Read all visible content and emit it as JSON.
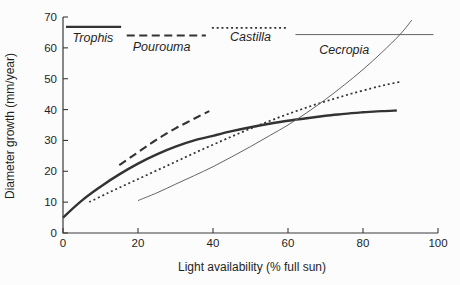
{
  "figure": {
    "background": "#fcfcfc",
    "axis_color": "#3a3a3a",
    "text_color": "#1f1f1f"
  },
  "chart_data": {
    "type": "line",
    "title": "",
    "xlabel": "Light availability (% full sun)",
    "ylabel": "Diameter growth (mm/year)",
    "xlim": [
      0,
      100
    ],
    "ylim": [
      0,
      70
    ],
    "x_ticks": [
      0,
      20,
      40,
      60,
      80,
      100
    ],
    "y_ticks": [
      0,
      10,
      20,
      30,
      40,
      50,
      60,
      70
    ],
    "grid": false,
    "legend_position": "staggered-inside-top",
    "series": [
      {
        "name": "Trophis",
        "style": "solid-thick",
        "color": "#333333",
        "points": [
          [
            0,
            5
          ],
          [
            5,
            10.5
          ],
          [
            10,
            15
          ],
          [
            15,
            19
          ],
          [
            20,
            22.5
          ],
          [
            25,
            25.5
          ],
          [
            30,
            28
          ],
          [
            35,
            30
          ],
          [
            40,
            31.5
          ],
          [
            45,
            33
          ],
          [
            50,
            34.3
          ],
          [
            55,
            35.4
          ],
          [
            60,
            36.4
          ],
          [
            65,
            37.2
          ],
          [
            70,
            38
          ],
          [
            75,
            38.6
          ],
          [
            80,
            39.1
          ],
          [
            85,
            39.5
          ],
          [
            89,
            39.7
          ]
        ]
      },
      {
        "name": "Pourouma",
        "style": "dashed",
        "color": "#333333",
        "points": [
          [
            15,
            22
          ],
          [
            18,
            24.5
          ],
          [
            21,
            27
          ],
          [
            24,
            29.5
          ],
          [
            27,
            31.8
          ],
          [
            30,
            33.9
          ],
          [
            33,
            35.8
          ],
          [
            36,
            37.7
          ],
          [
            39,
            39.5
          ]
        ]
      },
      {
        "name": "Castilla",
        "style": "dotted",
        "color": "#333333",
        "points": [
          [
            7,
            10
          ],
          [
            12,
            13
          ],
          [
            17,
            15.8
          ],
          [
            22,
            18.6
          ],
          [
            27,
            21.4
          ],
          [
            32,
            24.2
          ],
          [
            37,
            27
          ],
          [
            42,
            29.7
          ],
          [
            47,
            32.3
          ],
          [
            52,
            34.8
          ],
          [
            57,
            37.2
          ],
          [
            62,
            39.4
          ],
          [
            67,
            41.5
          ],
          [
            72,
            43.4
          ],
          [
            77,
            45.2
          ],
          [
            82,
            46.8
          ],
          [
            86,
            48
          ],
          [
            90,
            49
          ]
        ]
      },
      {
        "name": "Cecropia",
        "style": "solid-thin",
        "color": "#646464",
        "points": [
          [
            20,
            10.5
          ],
          [
            25,
            13
          ],
          [
            30,
            15.8
          ],
          [
            35,
            18.6
          ],
          [
            40,
            21.5
          ],
          [
            45,
            24.7
          ],
          [
            50,
            28
          ],
          [
            55,
            31.5
          ],
          [
            60,
            35
          ],
          [
            65,
            39
          ],
          [
            70,
            43.3
          ],
          [
            75,
            48
          ],
          [
            80,
            53
          ],
          [
            85,
            58.5
          ],
          [
            90,
            64.5
          ],
          [
            93,
            69
          ]
        ]
      }
    ],
    "legend": [
      {
        "label": "Trophis",
        "style": "solid-thick",
        "color": "#333333",
        "line": {
          "x1": 0.8,
          "x2": 15.5,
          "y": 66.8
        },
        "text_at": {
          "x": 8,
          "y": 62.0
        }
      },
      {
        "label": "Pourouma",
        "style": "dashed",
        "color": "#333333",
        "line": {
          "x1": 17.0,
          "x2": 38.1,
          "y": 64.0
        },
        "text_at": {
          "x": 26.3,
          "y": 59.0
        }
      },
      {
        "label": "Castilla",
        "style": "dotted",
        "color": "#333333",
        "line": {
          "x1": 39.7,
          "x2": 60.0,
          "y": 66.5
        },
        "text_at": {
          "x": 50,
          "y": 62.3
        }
      },
      {
        "label": "Cecropia",
        "style": "solid-thin",
        "color": "#646464",
        "line": {
          "x1": 62.0,
          "x2": 98.8,
          "y": 64.3
        },
        "text_at": {
          "x": 75,
          "y": 58.0
        }
      }
    ]
  }
}
